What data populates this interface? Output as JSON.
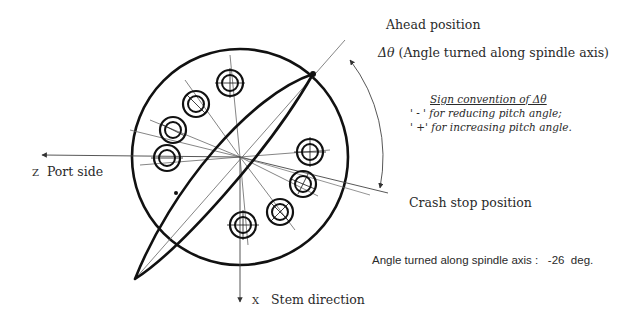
{
  "diagram": {
    "labels": {
      "ahead_position": "Ahead position",
      "delta_theta_symbol": "Δθ",
      "delta_theta_desc": "(Angle turned along spindle axis)",
      "sign_convention_title": "Sign convention of Δθ",
      "sign_minus": "' - '  for reducing pitch angle;",
      "sign_plus": "' +'  for increasing pitch angle.",
      "crash_stop_position": "Crash stop position",
      "z_axis": "Z",
      "z_axis_desc": "Port side",
      "x_axis": "X",
      "x_axis_desc": "Stem direction",
      "angle_readout_label": "Angle turned along spindle axis :",
      "angle_readout_value": "-26",
      "angle_readout_unit": "deg."
    },
    "geometry": {
      "hub_center": [
        240,
        157
      ],
      "hub_radius": 108,
      "bolt_count": 8,
      "blade_tips": [
        [
          313,
          74
        ],
        [
          135,
          279
        ]
      ]
    },
    "colors": {
      "line": "#111111",
      "thin_line": "#555555",
      "text": "#2a2a2a",
      "background": "#ffffff"
    }
  }
}
